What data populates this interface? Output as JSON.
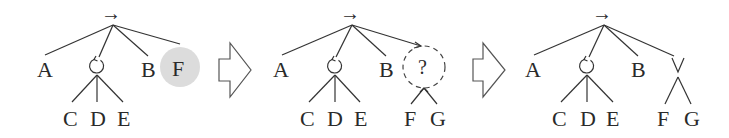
{
  "diagram": {
    "colors": {
      "line": "#333333",
      "text": "#2a2a2a",
      "highlight_fill": "#dcdcdc",
      "dashed_circle": "#444444",
      "transition_arrow": "#555555"
    },
    "panels": [
      {
        "id": "panel-1",
        "root_operator": "→",
        "children": [
          "A",
          "↻",
          "B",
          "F"
        ],
        "loop_children": [
          "C",
          "D",
          "E"
        ],
        "highlighted_node": "F"
      },
      {
        "id": "panel-2",
        "root_operator": "→",
        "children": [
          "A",
          "↻",
          "B",
          "?"
        ],
        "loop_children": [
          "C",
          "D",
          "E"
        ],
        "unknown_node_label": "?",
        "unknown_children": [
          "F",
          "G"
        ]
      },
      {
        "id": "panel-3",
        "root_operator": "→",
        "children": [
          "A",
          "↻",
          "B",
          "∨"
        ],
        "loop_children": [
          "C",
          "D",
          "E"
        ],
        "choice_children": [
          "F",
          "G"
        ]
      }
    ],
    "transitions": [
      "block-arrow",
      "block-arrow"
    ]
  },
  "labels": {
    "p1": {
      "root": "→",
      "a": "A",
      "b": "B",
      "f": "F",
      "c": "C",
      "d": "D",
      "e": "E"
    },
    "p2": {
      "root": "→",
      "a": "A",
      "b": "B",
      "q": "?",
      "f": "F",
      "g": "G",
      "c": "C",
      "d": "D",
      "e": "E"
    },
    "p3": {
      "root": "→",
      "a": "A",
      "b": "B",
      "f": "F",
      "g": "G",
      "c": "C",
      "d": "D",
      "e": "E"
    }
  }
}
